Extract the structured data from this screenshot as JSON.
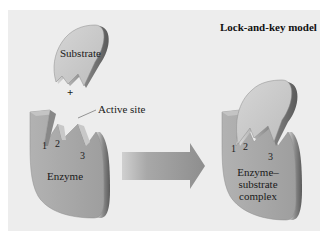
{
  "title": "Lock-and-key model",
  "left": {
    "substrate_label": "Substrate",
    "plus": "+",
    "active_site_label": "Active site",
    "enzyme_label": "Enzyme",
    "site_numbers": [
      "1",
      "2",
      "3"
    ]
  },
  "right": {
    "complex_label_lines": [
      "Enzyme–",
      "substrate",
      "complex"
    ],
    "site_numbers": [
      "1",
      "2",
      "3"
    ]
  },
  "colors": {
    "background": "#ededed",
    "frame": "#ffffff",
    "shape_fill": "#a8a8a8",
    "substrate_fill": "#c9c9c9",
    "arrow_fill": "#a0a0a0"
  }
}
